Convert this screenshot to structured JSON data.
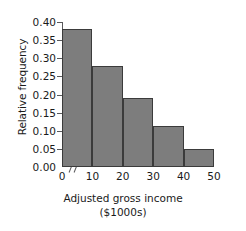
{
  "chart_data": {
    "type": "bar",
    "title": "",
    "subtitle": "",
    "xlabel": "Adjusted gross income",
    "xlabel_line2": "($1000s)",
    "ylabel": "Relative frequency",
    "categories": [
      "0-10",
      "10-20",
      "20-30",
      "30-40",
      "40-50"
    ],
    "bin_edges": [
      0,
      10,
      20,
      30,
      40,
      50
    ],
    "values": [
      0.38,
      0.278,
      0.19,
      0.112,
      0.05
    ],
    "xlim": [
      0,
      50
    ],
    "ylim": [
      0.0,
      0.4
    ],
    "x_ticks": [
      "0",
      "10",
      "20",
      "30",
      "40",
      "50"
    ],
    "x_tick_values": [
      0,
      10,
      20,
      30,
      40,
      50
    ],
    "y_ticks": [
      "0.00",
      "0.05",
      "0.10",
      "0.15",
      "0.20",
      "0.25",
      "0.30",
      "0.35",
      "0.40"
    ],
    "y_tick_values": [
      0.0,
      0.05,
      0.1,
      0.15,
      0.2,
      0.25,
      0.3,
      0.35,
      0.4
    ],
    "grid": false,
    "legend": false,
    "legend_position": "none",
    "axis_break_x": true,
    "bar_fill_color": "#7d7d7d",
    "bar_edge_color": "#3b3b3b",
    "axis_color": "#59595b",
    "background_color": "#ffffff"
  }
}
